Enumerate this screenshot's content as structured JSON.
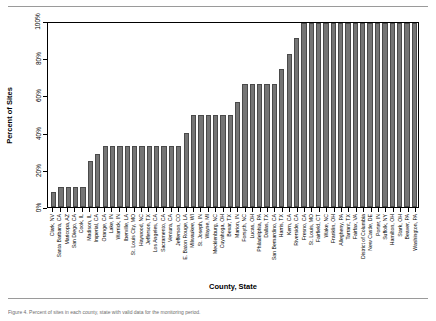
{
  "page": {
    "caption": "Figure 4. Percent of sites in each county, state with valid data for the monitoring period."
  },
  "chart_data": {
    "type": "bar",
    "title": "",
    "xlabel": "County, State",
    "ylabel": "Percent of Sites",
    "ylim": [
      0,
      100
    ],
    "yticks": [
      0,
      20,
      40,
      60,
      80,
      100
    ],
    "ytick_labels": [
      "0%",
      "20%",
      "40%",
      "60%",
      "80%",
      "100%"
    ],
    "grid": false,
    "legend": null,
    "bar_color": "#757575",
    "categories": [
      "Clark, NV",
      "Santa Barbara, CA",
      "Maricopa, AZ",
      "San Diego, CA",
      "Cook, IL",
      "Madison, IL",
      "Imperial, CA",
      "Orange, CA",
      "Lake, IN",
      "Warrick, IN",
      "Iberville, LA",
      "St. Louis City, MO",
      "Haywood, NC",
      "Jefferson, TX",
      "Los Angeles, CA",
      "Sacramento, CA",
      "Ventura, CA",
      "Jefferson, CO",
      "E. Baton Rouge, LA",
      "Milwaukee, WI",
      "St. Joseph, IN",
      "Wayne, MI",
      "Mecklenburg, NC",
      "Cuyahoga, OH",
      "Bexar, TX",
      "Marion, IN",
      "Forsyth, NC",
      "Lucas, OH",
      "Philadelphia, PA",
      "Dallas, TX",
      "San Bernardino, CA",
      "Harris, TX",
      "Kern, CA",
      "Riverside, CA",
      "Fresno, CA",
      "St. Louis, MO",
      "Fairfield, CT",
      "Wake, NC",
      "Franklin, OH",
      "Allegheny, PA",
      "Tarrant, TX",
      "Fairfax, VA",
      "District of Columbia",
      "New Castle, DE",
      "Porter, IN",
      "Suffolk, NY",
      "Hamilton, OH",
      "Stark, OH",
      "Beaver, PA",
      "Washington, PA"
    ],
    "values": [
      8,
      11,
      11,
      11,
      11,
      25,
      29,
      33,
      33,
      33,
      33,
      33,
      33,
      33,
      33,
      33,
      33,
      33,
      40,
      50,
      50,
      50,
      50,
      50,
      50,
      57,
      67,
      67,
      67,
      67,
      67,
      75,
      83,
      92,
      100,
      100,
      100,
      100,
      100,
      100,
      100,
      100,
      100,
      100,
      100,
      100,
      100,
      100,
      100,
      100
    ]
  }
}
